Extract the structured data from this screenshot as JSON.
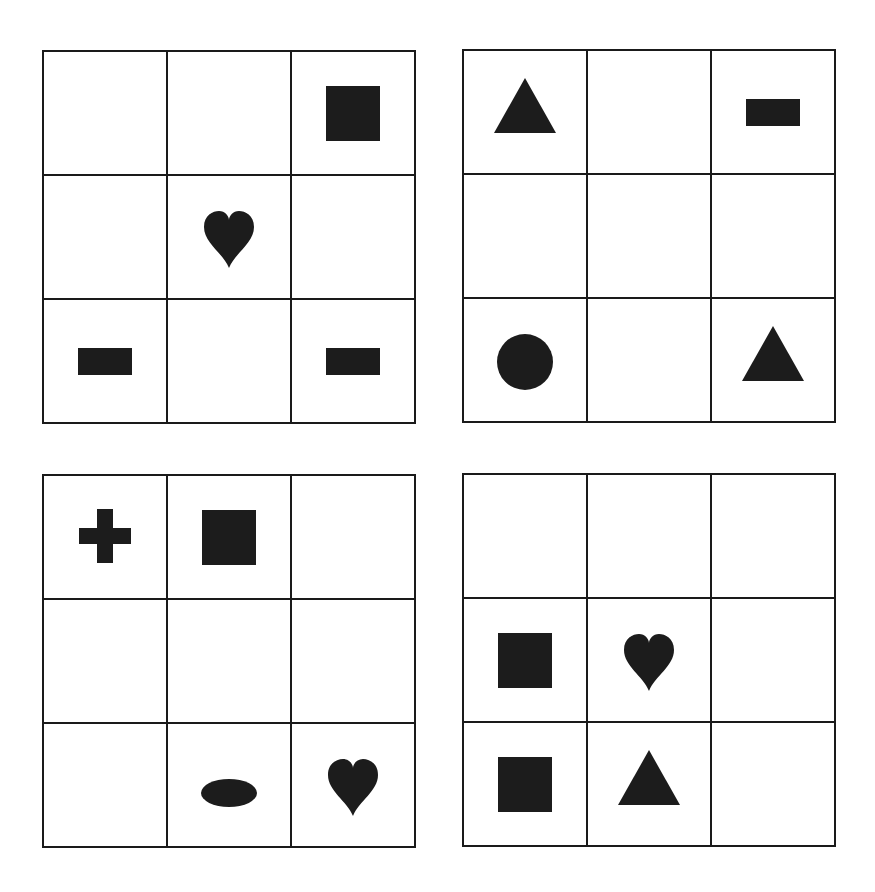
{
  "colors": {
    "line": "#1a1a1a",
    "shape": "#1c1c1c",
    "background": "#ffffff"
  },
  "grids": [
    {
      "name": "grid-top-left",
      "x": 43,
      "y": 51,
      "cells": [
        [
          "",
          "",
          "square"
        ],
        [
          "",
          "heart",
          ""
        ],
        [
          "bar",
          "",
          "bar"
        ]
      ]
    },
    {
      "name": "grid-top-right",
      "x": 463,
      "y": 50,
      "cells": [
        [
          "triangle",
          "",
          "bar"
        ],
        [
          "",
          "",
          ""
        ],
        [
          "circle",
          "",
          "triangle"
        ]
      ]
    },
    {
      "name": "grid-bottom-left",
      "x": 43,
      "y": 475,
      "cells": [
        [
          "cross",
          "square",
          ""
        ],
        [
          "",
          "",
          ""
        ],
        [
          "",
          "ellipse",
          "heart"
        ]
      ]
    },
    {
      "name": "grid-bottom-right",
      "x": 463,
      "y": 474,
      "cells": [
        [
          "",
          "",
          ""
        ],
        [
          "square",
          "heart",
          ""
        ],
        [
          "square",
          "triangle",
          ""
        ]
      ]
    }
  ]
}
